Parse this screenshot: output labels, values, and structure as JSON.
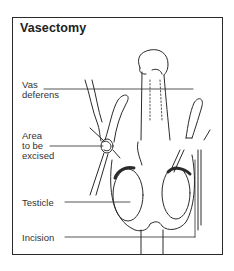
{
  "figure": {
    "title": "Vasectomy",
    "labels": [
      {
        "id": "vas-deferens",
        "lines": [
          "Vas",
          "deferens"
        ]
      },
      {
        "id": "area-to-be-excised",
        "lines": [
          "Area",
          "to be",
          "excised"
        ]
      },
      {
        "id": "testicle",
        "lines": [
          "Testicle"
        ]
      },
      {
        "id": "incision",
        "lines": [
          "Incision"
        ]
      }
    ]
  },
  "colors": {
    "ink": "#2a2a2a",
    "background": "#ffffff"
  }
}
